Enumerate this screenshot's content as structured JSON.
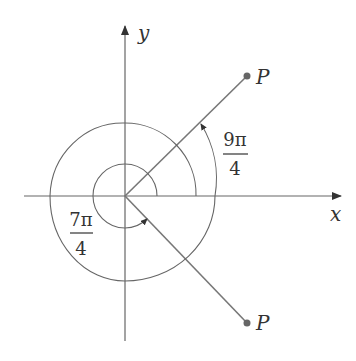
{
  "diagram": {
    "type": "angle-in-standard-position",
    "axes": {
      "x_label": "x",
      "y_label": "y"
    },
    "points": [
      {
        "label": "P",
        "position": "first quadrant, terminal side at 9π/4 (45°)"
      },
      {
        "label": "P",
        "position": "fourth quadrant, terminal side at 7π/4 (315°)"
      }
    ],
    "angles": [
      {
        "label_numerator": "9π",
        "label_denominator": "4",
        "direction": "counterclockwise",
        "description": "spiral arc > one full rotation"
      },
      {
        "label_numerator": "7π",
        "label_denominator": "4",
        "direction": "counterclockwise",
        "description": "arc of 7/8 rotation"
      }
    ],
    "colors": {
      "line": "#666666",
      "point": "#666666",
      "text": "#333333"
    }
  }
}
